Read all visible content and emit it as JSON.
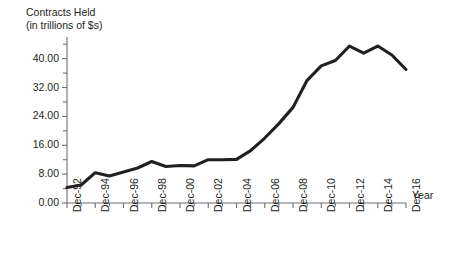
{
  "chart_data": {
    "type": "line",
    "title": "Contracts Held",
    "subtitle": "(in trillions of $s)",
    "xlabel": "Year",
    "ylabel": "",
    "grid": false,
    "legend": "none",
    "line_color": "#231f20",
    "axis_color": "#6d6e71",
    "text_color": "#231f20",
    "ylim": [
      0,
      46
    ],
    "y_ticks_major": [
      "0.00",
      "8.00",
      "16.00",
      "24.00",
      "32.00",
      "40.00"
    ],
    "y_tick_values": [
      0,
      8,
      16,
      24,
      32,
      40
    ],
    "y_minor_step": 4,
    "x_tick_labels": [
      "Dec-92",
      "Dec-94",
      "Dec-96",
      "Dec-98",
      "Dec-00",
      "Dec-02",
      "Dec-04",
      "Dec-06",
      "Dec-08",
      "Dec-10",
      "Dec-12",
      "Dec-14",
      "Dec-16"
    ],
    "x": [
      1992,
      1993,
      1994,
      1995,
      1996,
      1997,
      1998,
      1999,
      2000,
      2001,
      2002,
      2003,
      2004,
      2005,
      2006,
      2007,
      2008,
      2009,
      2010,
      2011,
      2012,
      2013,
      2014,
      2015,
      2016
    ],
    "values": [
      4.3,
      5.0,
      8.4,
      7.5,
      8.6,
      9.7,
      11.5,
      10.1,
      10.4,
      10.3,
      12.0,
      12.0,
      12.1,
      14.5,
      18.0,
      22.0,
      26.5,
      34.0,
      38.0,
      39.5,
      43.5,
      41.5,
      43.5,
      41.0,
      37.0
    ]
  },
  "labels": {
    "title_line1": "Contracts Held",
    "title_line2": "(in trillions of $s)",
    "year_axis": "Year"
  }
}
